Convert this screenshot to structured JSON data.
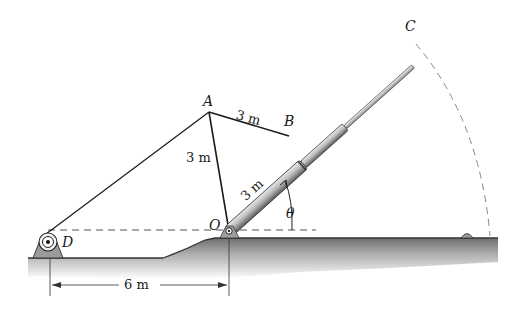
{
  "figure": {
    "points": {
      "A": {
        "label": "A"
      },
      "B": {
        "label": "B"
      },
      "C": {
        "label": "C"
      },
      "D": {
        "label": "D"
      },
      "O": {
        "label": "O"
      }
    },
    "angle": {
      "label": "θ"
    },
    "dimensions": {
      "AB": "3 m",
      "AO": "3 m",
      "OB": "3 m",
      "DO_horizontal": "6 m"
    }
  },
  "colors": {
    "line": "#1a1a1a",
    "dashed": "#555555",
    "ground": "#8a8a8a",
    "cylinder": "#b5b5b5"
  }
}
